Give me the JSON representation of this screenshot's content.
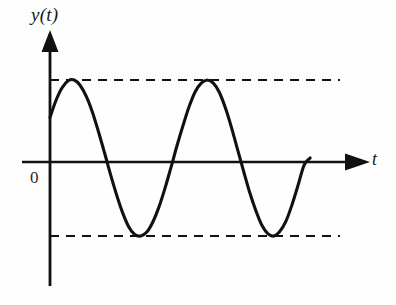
{
  "figure": {
    "background_color": "#fefefe",
    "stroke_color": "#111111",
    "labels": {
      "y_axis": "y(t)",
      "t_axis": "t",
      "origin": "0"
    }
  },
  "chart_data": {
    "type": "line",
    "title": "",
    "xlabel": "t",
    "ylabel": "y(t)",
    "grid": false,
    "legend": null,
    "series": [
      {
        "name": "y(t)",
        "style": "solid",
        "x": [
          0.0,
          0.1,
          0.2,
          0.3,
          0.4,
          0.5,
          0.6,
          0.7,
          0.8,
          0.9,
          1.0,
          1.1,
          1.2,
          1.3,
          1.4,
          1.5,
          1.6,
          1.7,
          1.8,
          1.9,
          2.0,
          2.1,
          2.2,
          2.3,
          2.4,
          2.5,
          2.6,
          2.7,
          2.8,
          2.9,
          3.0,
          3.1,
          3.2,
          3.3,
          3.4,
          3.5,
          3.6,
          3.7,
          3.8,
          3.9,
          4.0,
          4.1,
          4.2,
          4.3
        ],
        "y": [
          0.52,
          0.74,
          0.9,
          0.99,
          1.0,
          0.93,
          0.79,
          0.59,
          0.34,
          0.07,
          -0.21,
          -0.47,
          -0.7,
          -0.88,
          -0.98,
          -1.0,
          -0.95,
          -0.82,
          -0.63,
          -0.39,
          -0.12,
          0.16,
          0.42,
          0.66,
          0.85,
          0.96,
          1.0,
          0.96,
          0.84,
          0.64,
          0.39,
          0.11,
          -0.17,
          -0.44,
          -0.67,
          -0.86,
          -0.97,
          -1.0,
          -0.94,
          -0.81,
          -0.6,
          -0.35,
          -0.09,
          0.0
        ]
      }
    ],
    "annotations": [
      {
        "name": "upper-envelope",
        "type": "horizontal-dashed-line",
        "y": 1.0,
        "label": "",
        "x_range": [
          0.0,
          4.95
        ]
      },
      {
        "name": "lower-envelope",
        "type": "horizontal-dashed-line",
        "y": -1.0,
        "label": "",
        "x_range": [
          0.0,
          4.95
        ]
      }
    ],
    "axes": {
      "x_axis": {
        "label": "t",
        "arrow": true,
        "ticks": [],
        "range": [
          -0.35,
          5.3
        ]
      },
      "y_axis": {
        "label": "y(t)",
        "arrow": true,
        "ticks": [],
        "range": [
          -2.1,
          1.65
        ]
      },
      "origin_label": "0"
    }
  }
}
